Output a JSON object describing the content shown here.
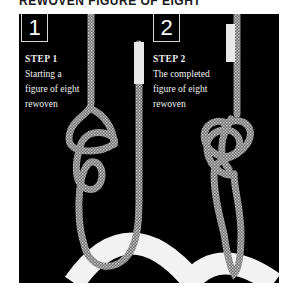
{
  "page": {
    "title": "REWOVEN FIGURE OF EIGHT"
  },
  "steps": [
    {
      "number": "1",
      "heading": "STEP 1",
      "lines": [
        "Starting a",
        "figure of eight",
        "rewoven"
      ]
    },
    {
      "number": "2",
      "heading": "STEP 2",
      "lines": [
        "The completed",
        "figure of eight",
        "rewoven"
      ]
    }
  ],
  "colors": {
    "background": "#000000",
    "rope": "#9a9a9a",
    "anchor": "#f4f4f4",
    "text": "#ffffff"
  }
}
